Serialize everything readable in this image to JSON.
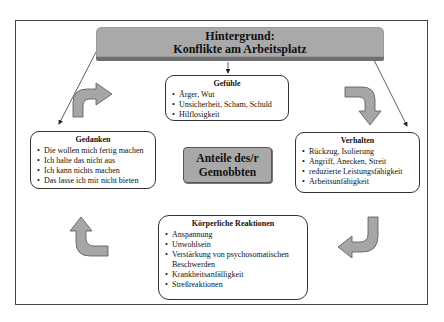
{
  "header": {
    "line1": "Hintergrund:",
    "line2": "Konflikte am Arbeitsplatz"
  },
  "center": {
    "line1": "Anteile des/r",
    "line2": "Gemobbten"
  },
  "boxes": {
    "gefuehle": {
      "title": "Gefühle",
      "items": [
        "Ärger, Wut",
        "Unsicherheit, Scham, Schuld",
        "Hilflosigkeit"
      ]
    },
    "gedanken": {
      "title": "Gedanken",
      "items": [
        "Die wollen mich fertig machen",
        "Ich halte das nicht aus",
        "Ich kann nichts machen",
        "Das lasse ich mir nicht bieten"
      ]
    },
    "verhalten": {
      "title": "Verhalten",
      "items": [
        "Rückzug, Isolierung",
        "Angriff, Anecken, Streit",
        "reduzierte Leistungsfähigkeit",
        "Arbeitsunfähigkeit"
      ]
    },
    "koerper": {
      "title": "Körperliche Reaktionen",
      "items": [
        "Anspannung",
        "Unwohlsein",
        "Verstärkung von psychosomatischen Beschwerden",
        "Krankheitsanfälligkeit",
        "Streßreaktionen"
      ]
    }
  },
  "icons": {
    "arrow_top_left": "curved-arrow-up-right",
    "arrow_top_right": "curved-arrow-right-down",
    "arrow_bottom_right": "curved-arrow-down-left",
    "arrow_bottom_left": "curved-arrow-left-up"
  },
  "colors": {
    "banner": "#a9a9a9",
    "banner_shadow": "#6f6f6f",
    "center_box": "#a8a8a8",
    "arrow_fill": "#a6a6a6",
    "border": "#333333"
  }
}
